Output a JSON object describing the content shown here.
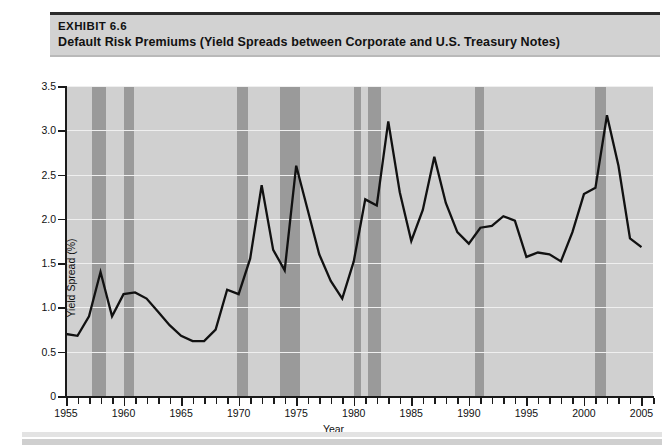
{
  "exhibit": {
    "label": "EXHIBIT 6.6",
    "title": "Default Risk Premiums (Yield Spreads between Corporate and U.S. Treasury Notes)"
  },
  "chart_data": {
    "type": "line",
    "title": "Default Risk Premiums (Yield Spreads between Corporate and U.S. Treasury Notes)",
    "xlabel": "Year",
    "ylabel": "Yield Spread (%)",
    "xlim": [
      1955,
      2006
    ],
    "ylim": [
      0,
      3.5
    ],
    "grid": true,
    "legend": "none",
    "y_ticks": [
      "0",
      "0.5",
      "1.0",
      "1.5",
      "2.0",
      "2.5",
      "3.0",
      "3.5"
    ],
    "y_tick_values": [
      0,
      0.5,
      1.0,
      1.5,
      2.0,
      2.5,
      3.0,
      3.5
    ],
    "x_ticks": [
      "1955",
      "1960",
      "1965",
      "1970",
      "1975",
      "1980",
      "1985",
      "1990",
      "1995",
      "2000",
      "2005"
    ],
    "x_tick_values": [
      1955,
      1960,
      1965,
      1970,
      1975,
      1980,
      1985,
      1990,
      1995,
      2000,
      2005
    ],
    "series": [
      {
        "name": "Yield Spread",
        "color": "#111111",
        "x": [
          1955,
          1956,
          1957,
          1958,
          1959,
          1960,
          1961,
          1962,
          1963,
          1964,
          1965,
          1966,
          1967,
          1968,
          1969,
          1970,
          1971,
          1972,
          1973,
          1974,
          1975,
          1976,
          1977,
          1978,
          1979,
          1980,
          1981,
          1982,
          1983,
          1984,
          1985,
          1986,
          1987,
          1988,
          1989,
          1990,
          1991,
          1992,
          1993,
          1994,
          1995,
          1996,
          1997,
          1998,
          1999,
          2000,
          2001,
          2002,
          2003,
          2004,
          2005
        ],
        "y": [
          0.7,
          0.68,
          0.9,
          1.4,
          0.9,
          1.15,
          1.17,
          1.1,
          0.95,
          0.8,
          0.68,
          0.62,
          0.62,
          0.75,
          1.2,
          1.15,
          1.55,
          2.38,
          1.65,
          1.42,
          2.6,
          2.1,
          1.6,
          1.3,
          1.1,
          1.52,
          2.22,
          2.15,
          3.1,
          2.3,
          1.75,
          2.1,
          2.7,
          2.18,
          1.85,
          1.72,
          1.9,
          1.92,
          2.03,
          1.98,
          1.57,
          1.62,
          1.6,
          1.52,
          1.85,
          2.28,
          2.35,
          3.17,
          2.6,
          1.78,
          1.68
        ]
      }
    ],
    "shaded_regions": {
      "name": "Recession bands",
      "color": "#9a9a9a",
      "spans": [
        [
          1957.3,
          1958.5
        ],
        [
          1960.0,
          1960.9
        ],
        [
          1969.9,
          1970.8
        ],
        [
          1973.6,
          1975.3
        ],
        [
          1980.0,
          1980.6
        ],
        [
          1981.2,
          1982.4
        ],
        [
          1990.5,
          1991.3
        ],
        [
          2001.0,
          2001.9
        ]
      ]
    }
  },
  "footer": {
    "bar_color_top": "#e3e3e3",
    "bar_color_bottom": "#cfcfcf"
  }
}
